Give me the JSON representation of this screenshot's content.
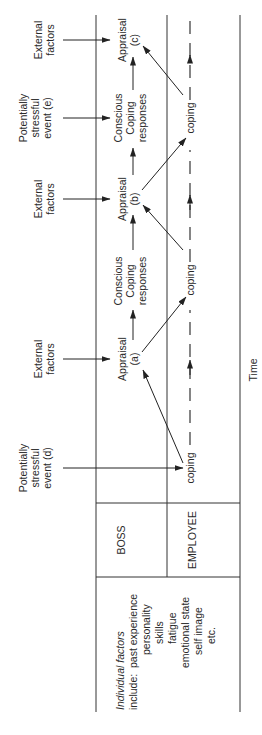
{
  "orientation": "rotated-90-ccw",
  "axis": {
    "time_label": "Time"
  },
  "rows": {
    "boss": "BOSS",
    "employee": "EMPLOYEE"
  },
  "individual_factors": {
    "heading": "Individual factors",
    "include_label": "include:",
    "items": [
      "past experience",
      "personality",
      "skills",
      "fatigue",
      "emotional state",
      "self image",
      "etc."
    ]
  },
  "inputs": [
    {
      "id": "d",
      "lines": [
        "Potentially",
        "stressful",
        "event (d)"
      ]
    },
    {
      "id": "ext-a",
      "lines": [
        "External",
        "factors"
      ]
    },
    {
      "id": "ext-b",
      "lines": [
        "External",
        "factors"
      ]
    },
    {
      "id": "e",
      "lines": [
        "Potentially",
        "stressful",
        "event (e)"
      ]
    },
    {
      "id": "ext-c",
      "lines": [
        "External",
        "factors"
      ]
    }
  ],
  "boss_nodes": [
    {
      "id": "appraisal-a",
      "lines": [
        "Appraisal",
        "(a)"
      ]
    },
    {
      "id": "ccr-1",
      "lines": [
        "Conscious",
        "Coping",
        "responses"
      ]
    },
    {
      "id": "appraisal-b",
      "lines": [
        "Appraisal",
        "(b)"
      ]
    },
    {
      "id": "ccr-2",
      "lines": [
        "Conscious",
        "Coping",
        "responses"
      ]
    },
    {
      "id": "appraisal-c",
      "lines": [
        "Appraisal",
        "(c)"
      ]
    }
  ],
  "employee_nodes": [
    {
      "id": "coping-1",
      "label": "coping"
    },
    {
      "id": "coping-2",
      "label": "coping"
    },
    {
      "id": "coping-3",
      "label": "coping"
    }
  ]
}
